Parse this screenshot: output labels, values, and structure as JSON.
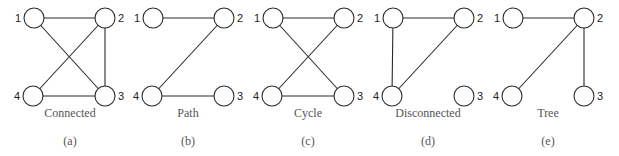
{
  "figure": {
    "panels": [
      {
        "id": "a",
        "caption": "Connected",
        "letter": "(a)",
        "offset_x": 0,
        "nodes": [
          {
            "id": "1",
            "label": "1",
            "x": 34,
            "y": 18,
            "label_side": "left"
          },
          {
            "id": "2",
            "label": "2",
            "x": 105,
            "y": 18,
            "label_side": "right"
          },
          {
            "id": "3",
            "label": "3",
            "x": 105,
            "y": 96,
            "label_side": "right"
          },
          {
            "id": "4",
            "label": "4",
            "x": 33,
            "y": 96,
            "label_side": "left"
          }
        ],
        "edges": [
          [
            "1",
            "2"
          ],
          [
            "1",
            "3"
          ],
          [
            "2",
            "4"
          ],
          [
            "2",
            "3"
          ],
          [
            "4",
            "3"
          ]
        ]
      },
      {
        "id": "b",
        "caption": "Path",
        "letter": "(b)",
        "offset_x": 120,
        "nodes": [
          {
            "id": "1",
            "label": "1",
            "x": 153,
            "y": 18,
            "label_side": "left"
          },
          {
            "id": "2",
            "label": "2",
            "x": 224,
            "y": 18,
            "label_side": "right"
          },
          {
            "id": "3",
            "label": "3",
            "x": 224,
            "y": 96,
            "label_side": "right"
          },
          {
            "id": "4",
            "label": "4",
            "x": 152,
            "y": 96,
            "label_side": "left"
          }
        ],
        "edges": [
          [
            "1",
            "2"
          ],
          [
            "2",
            "4"
          ],
          [
            "4",
            "3"
          ]
        ]
      },
      {
        "id": "c",
        "caption": "Cycle",
        "letter": "(c)",
        "offset_x": 240,
        "nodes": [
          {
            "id": "1",
            "label": "1",
            "x": 273,
            "y": 18,
            "label_side": "left"
          },
          {
            "id": "2",
            "label": "2",
            "x": 344,
            "y": 18,
            "label_side": "right"
          },
          {
            "id": "3",
            "label": "3",
            "x": 344,
            "y": 96,
            "label_side": "right"
          },
          {
            "id": "4",
            "label": "4",
            "x": 272,
            "y": 96,
            "label_side": "left"
          }
        ],
        "edges": [
          [
            "1",
            "2"
          ],
          [
            "1",
            "3"
          ],
          [
            "2",
            "4"
          ],
          [
            "4",
            "3"
          ]
        ]
      },
      {
        "id": "d",
        "caption": "Disconnected",
        "letter": "(d)",
        "offset_x": 360,
        "nodes": [
          {
            "id": "1",
            "label": "1",
            "x": 393,
            "y": 18,
            "label_side": "left"
          },
          {
            "id": "2",
            "label": "2",
            "x": 464,
            "y": 18,
            "label_side": "right"
          },
          {
            "id": "3",
            "label": "3",
            "x": 464,
            "y": 96,
            "label_side": "right"
          },
          {
            "id": "4",
            "label": "4",
            "x": 392,
            "y": 96,
            "label_side": "left"
          }
        ],
        "edges": [
          [
            "1",
            "2"
          ],
          [
            "1",
            "4"
          ],
          [
            "2",
            "4"
          ]
        ]
      },
      {
        "id": "e",
        "caption": "Tree",
        "letter": "(e)",
        "offset_x": 480,
        "nodes": [
          {
            "id": "1",
            "label": "1",
            "x": 513,
            "y": 18,
            "label_side": "left"
          },
          {
            "id": "2",
            "label": "2",
            "x": 584,
            "y": 18,
            "label_side": "right"
          },
          {
            "id": "3",
            "label": "3",
            "x": 584,
            "y": 96,
            "label_side": "right"
          },
          {
            "id": "4",
            "label": "4",
            "x": 512,
            "y": 96,
            "label_side": "left"
          }
        ],
        "edges": [
          [
            "1",
            "2"
          ],
          [
            "2",
            "4"
          ],
          [
            "2",
            "3"
          ]
        ]
      }
    ],
    "node_radius": 10,
    "colors": {
      "stroke": "#2a2a2a",
      "caption": "#555555",
      "background": "#ffffff"
    }
  }
}
